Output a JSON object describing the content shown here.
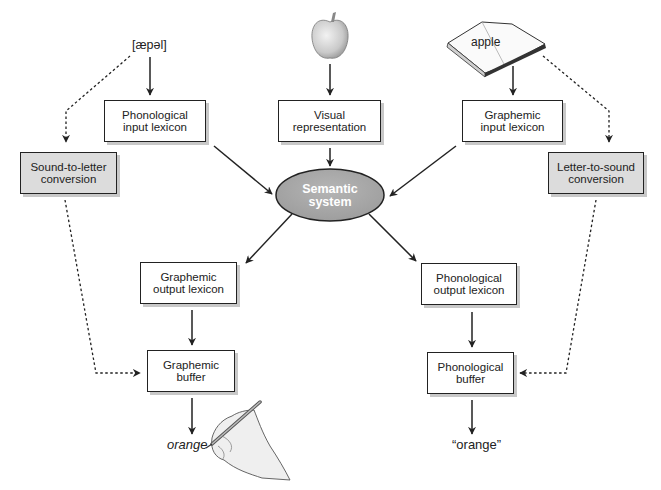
{
  "diagram": {
    "title": "",
    "inputs": {
      "auditory": "[æpəl]",
      "visual_object": "apple-icon",
      "written_word": "apple"
    },
    "boxes": {
      "phonological_input_lexicon": [
        "Phonological",
        "input lexicon"
      ],
      "visual_representation": [
        "Visual",
        "representation"
      ],
      "graphemic_input_lexicon": [
        "Graphemic",
        "input lexicon"
      ],
      "sound_to_letter": [
        "Sound-to-letter",
        "conversion"
      ],
      "letter_to_sound": [
        "Letter-to-sound",
        "conversion"
      ],
      "semantic_system": [
        "Semantic",
        "system"
      ],
      "graphemic_output_lexicon": [
        "Graphemic",
        "output lexicon"
      ],
      "phonological_output_lexicon": [
        "Phonological",
        "output lexicon"
      ],
      "graphemic_buffer": [
        "Graphemic",
        "buffer"
      ],
      "phonological_buffer": [
        "Phonological",
        "buffer"
      ]
    },
    "outputs": {
      "written": "orange",
      "spoken": "“orange”"
    },
    "edges": [
      {
        "from": "[æpəl]",
        "to": "Phonological input lexicon",
        "style": "solid"
      },
      {
        "from": "apple-icon",
        "to": "Visual representation",
        "style": "solid"
      },
      {
        "from": "book (apple)",
        "to": "Graphemic input lexicon",
        "style": "solid"
      },
      {
        "from": "[æpəl]",
        "to": "Sound-to-letter conversion",
        "style": "dotted"
      },
      {
        "from": "book (apple)",
        "to": "Letter-to-sound conversion",
        "style": "dotted"
      },
      {
        "from": "Phonological input lexicon",
        "to": "Semantic system",
        "style": "solid"
      },
      {
        "from": "Visual representation",
        "to": "Semantic system",
        "style": "solid"
      },
      {
        "from": "Graphemic input lexicon",
        "to": "Semantic system",
        "style": "solid"
      },
      {
        "from": "Semantic system",
        "to": "Graphemic output lexicon",
        "style": "solid"
      },
      {
        "from": "Semantic system",
        "to": "Phonological output lexicon",
        "style": "solid"
      },
      {
        "from": "Graphemic output lexicon",
        "to": "Graphemic buffer",
        "style": "solid"
      },
      {
        "from": "Phonological output lexicon",
        "to": "Phonological buffer",
        "style": "solid"
      },
      {
        "from": "Sound-to-letter conversion",
        "to": "Graphemic buffer",
        "style": "dotted"
      },
      {
        "from": "Letter-to-sound conversion",
        "to": "Phonological buffer",
        "style": "dotted"
      },
      {
        "from": "Graphemic buffer",
        "to": "orange (written)",
        "style": "solid"
      },
      {
        "from": "Phonological buffer",
        "to": "“orange” (spoken)",
        "style": "solid"
      }
    ],
    "colors": {
      "line": "#222222",
      "conversion_box_fill": "#dcdcdc",
      "semantic_fill": "#a9a9a9",
      "shadow": "#c8c8c8"
    }
  }
}
